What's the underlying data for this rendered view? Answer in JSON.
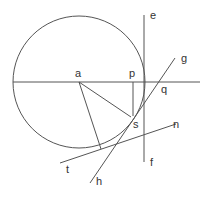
{
  "diagram": {
    "type": "geometry",
    "stroke_color": "#555555",
    "circle": {
      "center": "a",
      "cx": 79,
      "cy": 82,
      "r": 66
    },
    "labels": {
      "a": "a",
      "p": "p",
      "e": "e",
      "f": "f",
      "g": "g",
      "q": "q",
      "s": "s",
      "n": "n",
      "t": "t",
      "h": "h"
    },
    "lines": [
      {
        "name": "horizontal-diameter",
        "from": [
          13,
          82
        ],
        "to": [
          200,
          82
        ]
      },
      {
        "name": "vertical-line-e-f",
        "from": [
          144,
          15
        ],
        "to": [
          144,
          162
        ]
      },
      {
        "name": "perpendicular-p",
        "from": [
          133,
          82
        ],
        "to": [
          133,
          116
        ]
      },
      {
        "name": "tangent-g-h",
        "from": [
          175,
          58
        ],
        "to": [
          90,
          183
        ]
      },
      {
        "name": "tangent-t-n",
        "from": [
          60,
          163
        ],
        "to": [
          176,
          124
        ]
      },
      {
        "name": "radius-a-to-tangent-point",
        "from": [
          79,
          82
        ],
        "to": [
          101,
          149
        ]
      },
      {
        "name": "radius-a-to-s",
        "from": [
          79,
          82
        ],
        "to": [
          131,
          117
        ]
      }
    ]
  }
}
